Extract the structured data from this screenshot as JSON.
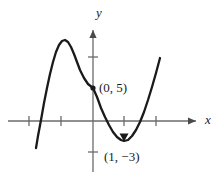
{
  "figure": {
    "background_color": "#ffffff",
    "curve_color": "#1a1a1a",
    "axis_color": "#6b6b6b",
    "text_color": "#1a1a1a"
  },
  "axes": {
    "x_label": "x",
    "y_label": "y",
    "origin_px": [
      93,
      121
    ],
    "unit_px": 31.5,
    "x_ticks_px": [
      29,
      61,
      124,
      156
    ],
    "y_ticks_px": [
      57,
      152
    ]
  },
  "annotations": {
    "point_a": "(0, 5)",
    "point_b": "(1, −3)"
  },
  "chart_data": {
    "type": "line",
    "title": "",
    "xlabel": "x",
    "ylabel": "y",
    "grid": false,
    "legend": null,
    "xlim": [
      -2.6,
      3.2
    ],
    "ylim": [
      -4.5,
      5.2
    ],
    "x_tick_values": [
      -2,
      -1,
      1,
      2
    ],
    "y_tick_values": [
      2,
      -1
    ],
    "annotated_points": [
      {
        "label": "(0, 5)",
        "x": 0,
        "y": 5,
        "marker": "dot"
      },
      {
        "label": "(1, −3)",
        "x": 1,
        "y": -3,
        "marker": "arrow"
      }
    ],
    "features": {
      "local_maximum": {
        "x": -1.0,
        "y": 6.4
      },
      "local_minimum": {
        "x": 1.0,
        "y": -3.0
      },
      "y_intercept": {
        "x": 0,
        "y": 5
      },
      "x_intercepts": [
        -1.68,
        0.62,
        1.6
      ]
    },
    "series": [
      {
        "name": "cubic curve",
        "points_px": [
          [
            36,
            148
          ],
          [
            38,
            136
          ],
          [
            41,
            120
          ],
          [
            44,
            103
          ],
          [
            47,
            88
          ],
          [
            50,
            74
          ],
          [
            53,
            62
          ],
          [
            56,
            52
          ],
          [
            59,
            45
          ],
          [
            62,
            41
          ],
          [
            65,
            40
          ],
          [
            68,
            42
          ],
          [
            71,
            47
          ],
          [
            74,
            54
          ],
          [
            77,
            62
          ],
          [
            80,
            70
          ],
          [
            84,
            78
          ],
          [
            88,
            84
          ],
          [
            93,
            88
          ],
          [
            97,
            97
          ],
          [
            101,
            108
          ],
          [
            105,
            117
          ],
          [
            109,
            125
          ],
          [
            113,
            132
          ],
          [
            117,
            137
          ],
          [
            121,
            140
          ],
          [
            124,
            141
          ],
          [
            128,
            140
          ],
          [
            132,
            136
          ],
          [
            136,
            130
          ],
          [
            140,
            122
          ],
          [
            144,
            112
          ],
          [
            148,
            100
          ],
          [
            152,
            87
          ],
          [
            156,
            73
          ],
          [
            160,
            58
          ]
        ]
      }
    ]
  }
}
